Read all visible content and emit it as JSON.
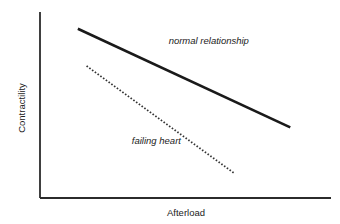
{
  "chart_data": {
    "type": "line",
    "title": "",
    "xlabel": "Afterload",
    "ylabel": "Contractility",
    "xlim": [
      0,
      10
    ],
    "ylim": [
      0,
      10
    ],
    "grid": false,
    "ticks": false,
    "series": [
      {
        "name": "normal relationship",
        "style": "solid",
        "color": "#1a1a1a",
        "points": [
          [
            1.3,
            9.1
          ],
          [
            8.6,
            3.8
          ]
        ]
      },
      {
        "name": "failing heart",
        "style": "dotted",
        "color": "#333333",
        "points": [
          [
            1.6,
            7.1
          ],
          [
            6.7,
            1.3
          ]
        ]
      }
    ],
    "annotations": [
      {
        "text": "normal relationship",
        "series": "normal relationship",
        "at": [
          5.8,
          8.3
        ]
      },
      {
        "text": "failing heart",
        "series": "failing heart",
        "at": [
          4.0,
          2.9
        ]
      }
    ]
  }
}
